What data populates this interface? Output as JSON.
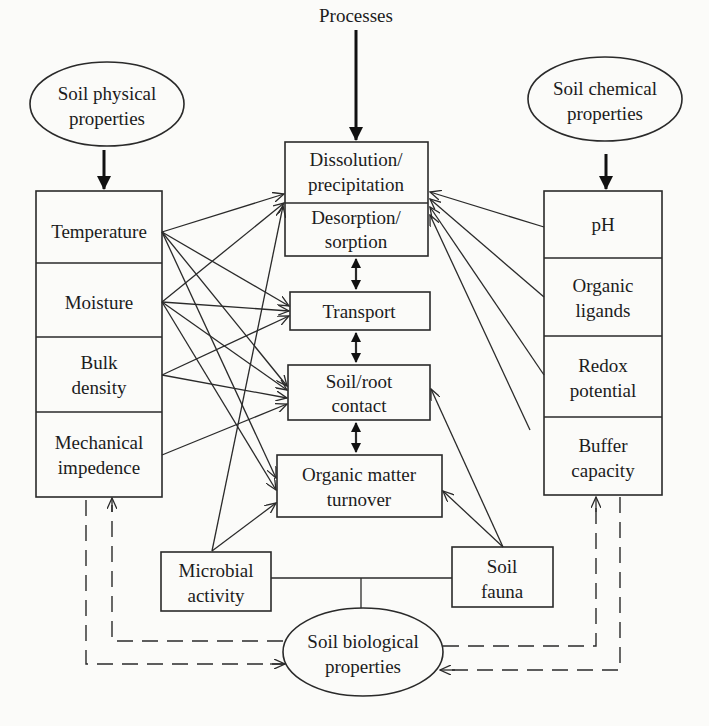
{
  "title": "Processes",
  "ovals": {
    "physical": [
      "Soil physical",
      "properties"
    ],
    "chemical": [
      "Soil chemical",
      "properties"
    ],
    "biological": [
      "Soil biological",
      "properties"
    ]
  },
  "physical_properties": [
    {
      "lines": [
        "Temperature"
      ]
    },
    {
      "lines": [
        "Moisture"
      ]
    },
    {
      "lines": [
        "Bulk",
        "density"
      ]
    },
    {
      "lines": [
        "Mechanical",
        "impedence"
      ]
    }
  ],
  "chemical_properties": [
    {
      "lines": [
        "pH"
      ]
    },
    {
      "lines": [
        "Organic",
        "ligands"
      ]
    },
    {
      "lines": [
        "Redox",
        "potential"
      ]
    },
    {
      "lines": [
        "Buffer",
        "capacity"
      ]
    }
  ],
  "processes": [
    {
      "lines": [
        "Dissolution/",
        "precipitation"
      ]
    },
    {
      "lines": [
        "Desorption/",
        "sorption"
      ]
    },
    {
      "lines": [
        "Transport"
      ]
    },
    {
      "lines": [
        "Soil/root",
        "contact"
      ]
    },
    {
      "lines": [
        "Organic matter",
        "turnover"
      ]
    }
  ],
  "biological_components": [
    {
      "lines": [
        "Microbial",
        "activity"
      ]
    },
    {
      "lines": [
        "Soil",
        "fauna"
      ]
    }
  ],
  "colors": {
    "line": "#2a2a2a",
    "background": "#fbfbf9",
    "text": "#1c1c1c"
  }
}
